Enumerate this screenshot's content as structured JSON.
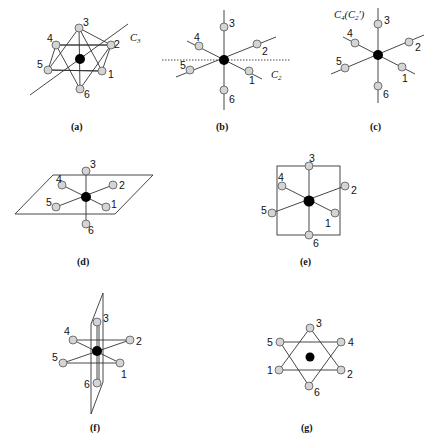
{
  "figure": {
    "panels": [
      {
        "id": "a",
        "caption": "(a)",
        "axis_label": "C",
        "axis_sub": "3",
        "ligands": [
          "1",
          "2",
          "3",
          "4",
          "5",
          "6"
        ]
      },
      {
        "id": "b",
        "caption": "(b)",
        "axis_label": "C",
        "axis_sub": "2",
        "ligands": [
          "1",
          "2",
          "3",
          "4",
          "5",
          "6"
        ]
      },
      {
        "id": "c",
        "caption": "(c)",
        "axis_label": "C",
        "axis_sub": "4",
        "axis_extra": "(C",
        "axis_extra_sub": "2",
        "axis_extra_end": "′)",
        "ligands": [
          "1",
          "2",
          "3",
          "4",
          "5",
          "6"
        ]
      },
      {
        "id": "d",
        "caption": "(d)",
        "ligands": [
          "1",
          "2",
          "3",
          "4",
          "5",
          "6"
        ]
      },
      {
        "id": "e",
        "caption": "(e)",
        "ligands": [
          "1",
          "2",
          "3",
          "4",
          "5",
          "6"
        ]
      },
      {
        "id": "f",
        "caption": "(f)",
        "ligands": [
          "1",
          "2",
          "3",
          "4",
          "5",
          "6"
        ]
      },
      {
        "id": "g",
        "caption": "(g)",
        "ligands": [
          "1",
          "2",
          "3",
          "4",
          "5",
          "6"
        ]
      }
    ],
    "colors": {
      "metal": "#000000",
      "ligand_fill": "#d4d4d4",
      "line": "#333333"
    }
  }
}
